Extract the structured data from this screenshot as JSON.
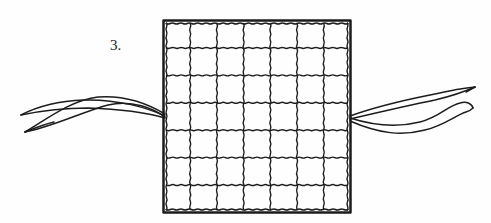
{
  "figure": {
    "step_label": "3.",
    "grid_rows": 7,
    "grid_cols": 7,
    "ink_color": "#1c1c1c",
    "background_color": "#fefefe"
  }
}
